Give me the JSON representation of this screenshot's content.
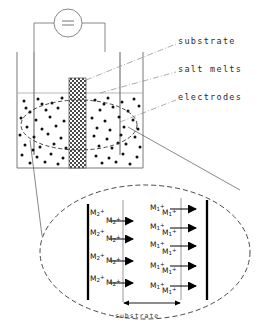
{
  "figure": {
    "title_labels": {
      "substrate": "substrate",
      "salt_melts": "salt melts",
      "electrodes": "electrodes",
      "substrate_bottom": "substrate"
    },
    "power_source": {
      "symbol": "=",
      "name": "dc-power-source"
    },
    "cell": {
      "beaker": "beaker-outline",
      "liquid_level": "salt-melt-level-line",
      "substrate_block": "hatched-substrate",
      "left_electrode": "left-electrode",
      "right_electrode": "right-electrode",
      "ion_dots_count": 92,
      "magnify_ellipse": "detail-region-ellipse"
    },
    "detail": {
      "ellipse": "magnified-detail-ellipse",
      "left_ion_label": {
        "base": "M",
        "subscript": "2",
        "superscript": "+"
      },
      "right_ion_label": {
        "base": "M",
        "subscript": "1",
        "superscript": "+"
      },
      "left_ion_rows": 4,
      "left_ions_per_row": 2,
      "right_ion_rows": 5,
      "right_ions_per_row": 2,
      "left_arrows": 4,
      "right_arrows": 5,
      "arrow_direction": "right",
      "electrode_bars": 2,
      "substrate_faces": 2,
      "dimension_arrow": "substrate-width-dimension"
    }
  },
  "colors": {
    "ink": "#2b2b2b",
    "line": "#5a5a5a",
    "bold": "#000000",
    "faint": "#9a9a9a"
  }
}
